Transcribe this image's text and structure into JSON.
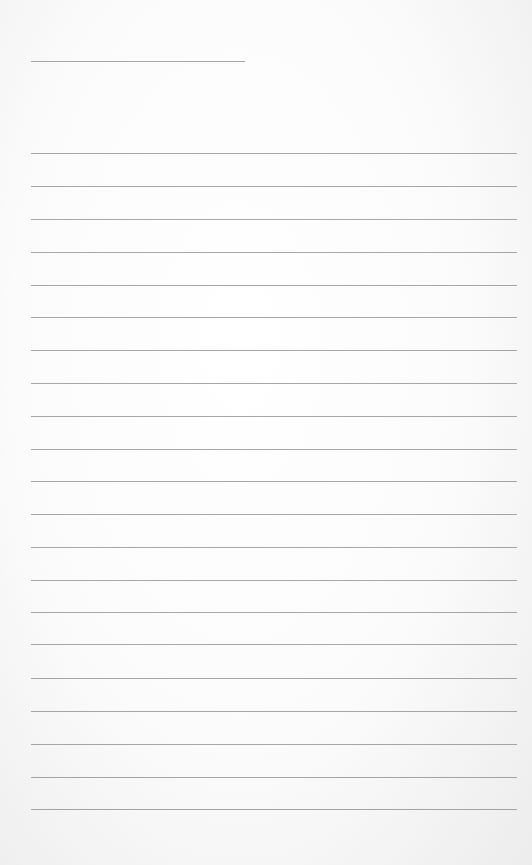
{
  "page": {
    "type": "blank lined paper",
    "title_line": {
      "x": 31,
      "y": 61,
      "width": 214
    },
    "rules": {
      "x": 31,
      "width": 486,
      "positions": [
        153,
        186,
        219,
        252,
        285,
        317,
        350,
        383,
        416,
        449,
        481,
        514,
        547,
        580,
        612,
        644,
        678,
        711,
        744,
        777,
        809
      ]
    },
    "colors": {
      "paper": "#fbfbfb",
      "rule": "#8a8a8a"
    }
  }
}
